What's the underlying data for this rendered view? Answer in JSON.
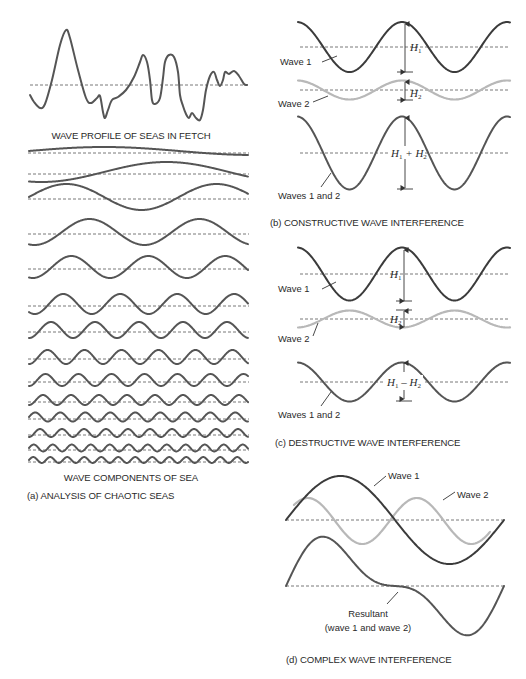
{
  "panel_a": {
    "profile_caption": "WAVE PROFILE OF SEAS IN FETCH",
    "components_caption": "WAVE COMPONENTS OF SEA",
    "panel_caption": "(a) ANALYSIS OF CHAOTIC SEAS",
    "profile_points": [
      [
        30,
        95
      ],
      [
        34,
        102
      ],
      [
        40,
        108
      ],
      [
        45,
        104
      ],
      [
        52,
        80
      ],
      [
        60,
        45
      ],
      [
        66,
        30
      ],
      [
        70,
        38
      ],
      [
        78,
        70
      ],
      [
        86,
        98
      ],
      [
        91,
        103
      ],
      [
        97,
        98
      ],
      [
        100,
        96
      ],
      [
        103,
        112
      ],
      [
        105,
        118
      ],
      [
        108,
        110
      ],
      [
        112,
        100
      ],
      [
        118,
        97
      ],
      [
        126,
        90
      ],
      [
        134,
        77
      ],
      [
        140,
        62
      ],
      [
        143,
        55
      ],
      [
        147,
        62
      ],
      [
        150,
        80
      ],
      [
        152,
        100
      ],
      [
        155,
        104
      ],
      [
        160,
        98
      ],
      [
        163,
        78
      ],
      [
        165,
        62
      ],
      [
        169,
        55
      ],
      [
        174,
        57
      ],
      [
        178,
        72
      ],
      [
        180,
        95
      ],
      [
        183,
        106
      ],
      [
        186,
        114
      ],
      [
        189,
        118
      ],
      [
        192,
        113
      ],
      [
        196,
        118
      ],
      [
        200,
        120
      ],
      [
        203,
        110
      ],
      [
        206,
        90
      ],
      [
        210,
        76
      ],
      [
        214,
        72
      ],
      [
        217,
        80
      ],
      [
        220,
        86
      ],
      [
        223,
        80
      ],
      [
        225,
        72
      ],
      [
        229,
        74
      ],
      [
        234,
        71
      ],
      [
        239,
        76
      ],
      [
        244,
        84
      ],
      [
        247,
        85
      ]
    ],
    "profile_baseline_y": 85,
    "components": [
      {
        "y": 151,
        "amp": 4,
        "period": 300,
        "phase": 0.25
      },
      {
        "y": 172,
        "amp": 10,
        "period": 250,
        "phase": 0.55
      },
      {
        "y": 197,
        "amp": 13,
        "period": 150,
        "phase": 0.25
      },
      {
        "y": 232,
        "amp": 13,
        "period": 110,
        "phase": 0.55
      },
      {
        "y": 267,
        "amp": 11,
        "period": 77,
        "phase": 0.55
      },
      {
        "y": 304,
        "amp": 10,
        "period": 57,
        "phase": 0.6
      },
      {
        "y": 330,
        "amp": 8,
        "period": 44,
        "phase": 0.5
      },
      {
        "y": 357,
        "amp": 7,
        "period": 37,
        "phase": 0.5
      },
      {
        "y": 380,
        "amp": 6,
        "period": 33,
        "phase": 0.5
      },
      {
        "y": 400,
        "amp": 5,
        "period": 28,
        "phase": 0.5
      },
      {
        "y": 417,
        "amp": 4.5,
        "period": 25,
        "phase": 0.25
      },
      {
        "y": 433,
        "amp": 4,
        "period": 22,
        "phase": 0.5
      },
      {
        "y": 448,
        "amp": 3.5,
        "period": 19,
        "phase": 0.25
      },
      {
        "y": 460,
        "amp": 3,
        "period": 17,
        "phase": 0.25
      }
    ]
  },
  "panel_b": {
    "wave1_label": "Wave 1",
    "wave2_label": "Wave 2",
    "result_label": "Waves 1 and 2",
    "h1": "H",
    "h1_sub": "1",
    "h2": "H",
    "h2_sub": "2",
    "sum_label": {
      "a": "H",
      "a_sub": "1",
      "op": " + ",
      "b": "H",
      "b_sub": "2"
    },
    "caption": "(b) CONSTRUCTIVE WAVE INTERFERENCE"
  },
  "panel_c": {
    "wave1_label": "Wave 1",
    "wave2_label": "Wave 2",
    "result_label": "Waves 1 and 2",
    "diff_label": {
      "a": "H",
      "a_sub": "1",
      "op": " – ",
      "b": "H",
      "b_sub": "2"
    },
    "caption": "(c) DESTRUCTIVE WAVE INTERFERENCE"
  },
  "panel_d": {
    "wave1_label": "Wave 1",
    "wave2_label": "Wave 2",
    "resultant_label": "Resultant",
    "resultant_sub": "(wave 1 and wave 2)",
    "caption": "(d) COMPLEX WAVE INTERFERENCE"
  },
  "colors": {
    "wave_dark": "#3b3b3b",
    "wave_light": "#b8b8b8",
    "text": "#2a2a2a",
    "background": "#ffffff"
  }
}
